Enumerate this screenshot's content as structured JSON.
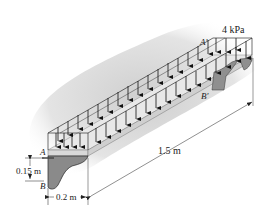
{
  "diagram": {
    "type": "engineering-mechanics",
    "load": {
      "label": "4 kPa",
      "value": 4,
      "unit": "kPa"
    },
    "dimensions": {
      "length": "1.5 m",
      "width": "0.2 m",
      "depth": "0.15 m"
    },
    "points": {
      "A": "A",
      "B": "B",
      "A_prime": "A′",
      "B_prime": "B′"
    },
    "colors": {
      "slab_top": "#e6e6e6",
      "slab_edge": "#bdbdbd",
      "bracket": "#8c8c8c",
      "shadow": "#d4d4d4",
      "lines": "#1a1a1a"
    }
  }
}
